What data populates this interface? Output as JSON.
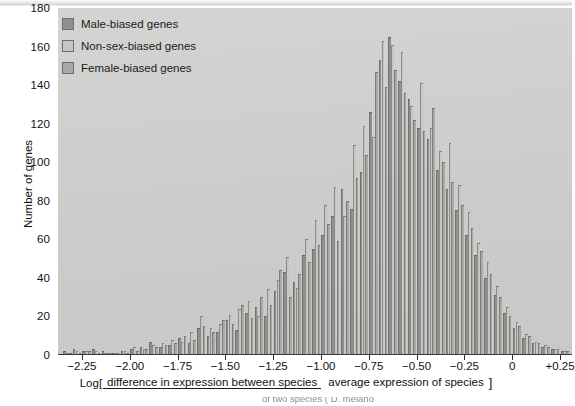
{
  "figure": {
    "background_color": "#cfcfcd",
    "cut_caption": "of two species ( D. melano"
  },
  "legend": {
    "position": "top-left-inside",
    "items": [
      {
        "label": "Male-biased genes",
        "color": "#8f8f8d",
        "name": "male-biased"
      },
      {
        "label": "Non-sex-biased genes",
        "color": "#c6c6c3",
        "name": "non-sex-biased"
      },
      {
        "label": "Female-biased genes",
        "color": "#a9a9a6",
        "name": "female-biased"
      }
    ]
  },
  "axes": {
    "y": {
      "title": "Number of genes",
      "ticks": [
        0,
        20,
        40,
        60,
        80,
        100,
        120,
        140,
        160,
        180
      ],
      "min": 0,
      "max": 180
    },
    "x": {
      "ticks": [
        -2.25,
        -2.0,
        -1.75,
        -1.5,
        -1.25,
        -1.0,
        -0.75,
        -0.5,
        -0.25,
        0,
        0.25
      ],
      "tick_labels": [
        "−2.25",
        "−2.00",
        "−1.75",
        "−1.50",
        "−1.25",
        "−1.00",
        "−0.75",
        "−0.50",
        "−0.25",
        "0",
        "+0.25"
      ],
      "min": -2.375,
      "max": 0.3125,
      "title_log": "Log[",
      "title_numerator": "difference in expression between species",
      "title_denominator": "average expression of species",
      "title_bracket": "]"
    }
  },
  "chart_data": {
    "type": "bar",
    "title": "",
    "xlabel": "Log[ difference in expression between species / average expression of species ]",
    "ylabel": "Number of genes",
    "ylim": [
      0,
      180
    ],
    "xlim": [
      -2.375,
      0.3125
    ],
    "grid": false,
    "legend_position": "upper left",
    "bin_width": 0.05,
    "categories": [
      -2.325,
      -2.275,
      -2.225,
      -2.175,
      -2.125,
      -2.075,
      -2.025,
      -1.975,
      -1.925,
      -1.875,
      -1.825,
      -1.775,
      -1.725,
      -1.675,
      -1.625,
      -1.575,
      -1.525,
      -1.475,
      -1.425,
      -1.375,
      -1.325,
      -1.275,
      -1.225,
      -1.175,
      -1.125,
      -1.075,
      -1.025,
      -0.975,
      -0.925,
      -0.875,
      -0.825,
      -0.775,
      -0.725,
      -0.675,
      -0.625,
      -0.575,
      -0.525,
      -0.475,
      -0.425,
      -0.375,
      -0.325,
      -0.275,
      -0.225,
      -0.175,
      -0.125,
      -0.075,
      -0.025,
      0.025,
      0.075,
      0.125,
      0.175,
      0.225,
      0.275
    ],
    "series": [
      {
        "name": "Male-biased genes",
        "color": "#8f8f8d",
        "values": [
          2,
          3,
          2,
          3,
          2,
          1,
          2,
          3,
          4,
          7,
          4,
          5,
          9,
          6,
          14,
          10,
          12,
          18,
          13,
          22,
          25,
          20,
          33,
          43,
          38,
          52,
          55,
          62,
          72,
          86,
          76,
          95,
          126,
          153,
          165,
          142,
          133,
          118,
          112,
          96,
          86,
          75,
          62,
          52,
          40,
          31,
          22,
          14,
          9,
          6,
          4,
          3,
          2
        ]
      },
      {
        "name": "Non-sex-biased genes",
        "color": "#c6c6c3",
        "values": [
          1,
          2,
          2,
          2,
          1,
          1,
          2,
          4,
          3,
          5,
          6,
          8,
          7,
          12,
          20,
          14,
          16,
          21,
          24,
          28,
          20,
          34,
          39,
          51,
          35,
          60,
          70,
          78,
          87,
          72,
          109,
          119,
          113,
          163,
          161,
          157,
          129,
          141,
          118,
          106,
          110,
          88,
          74,
          58,
          48,
          36,
          25,
          17,
          11,
          7,
          5,
          3,
          2
        ]
      },
      {
        "name": "Female-biased genes",
        "color": "#a9a9a6",
        "values": [
          1,
          1,
          2,
          1,
          1,
          1,
          1,
          2,
          3,
          4,
          5,
          6,
          10,
          8,
          15,
          12,
          18,
          16,
          26,
          19,
          30,
          26,
          44,
          30,
          42,
          48,
          57,
          68,
          59,
          80,
          92,
          104,
          147,
          139,
          148,
          136,
          122,
          116,
          128,
          100,
          90,
          78,
          66,
          54,
          42,
          30,
          20,
          15,
          10,
          6,
          4,
          3,
          2
        ]
      }
    ]
  }
}
